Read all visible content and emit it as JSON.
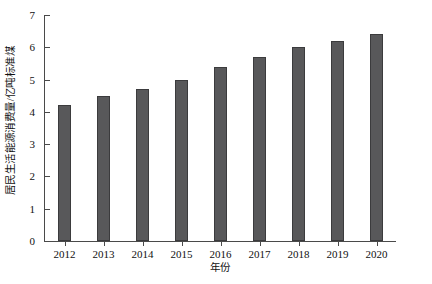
{
  "chart_data": {
    "type": "bar",
    "title": "",
    "subtitle": "",
    "xlabel": "年份",
    "ylabel": "居民生活能源消费量/亿吨标准煤",
    "categories": [
      "2012",
      "2013",
      "2014",
      "2015",
      "2016",
      "2017",
      "2018",
      "2019",
      "2020"
    ],
    "values": [
      4.2,
      4.5,
      4.7,
      5.0,
      5.4,
      5.7,
      6.0,
      6.2,
      6.4
    ],
    "series": [
      {
        "name": "居民生活能源消费量",
        "values": [
          4.2,
          4.5,
          4.7,
          5.0,
          5.4,
          5.7,
          6.0,
          6.2,
          6.4
        ]
      }
    ],
    "ylim": [
      0,
      7
    ],
    "yticks": [
      0,
      1,
      2,
      3,
      4,
      5,
      6,
      7
    ],
    "ytick_labels": [
      "0",
      "1",
      "2",
      "3",
      "4",
      "5",
      "6",
      "7"
    ],
    "xlim_categories": 9,
    "grid": false,
    "legend": false,
    "legend_position": "none",
    "bar_color": "#58585a",
    "bar_edge_color": "#3b3b3d",
    "axis_color": "#4a4a4a",
    "background_color": "#ffffff",
    "annotations": []
  },
  "axes": {
    "y_title": "居民生活能源消费量/亿吨标准煤",
    "x_title": "年份"
  }
}
